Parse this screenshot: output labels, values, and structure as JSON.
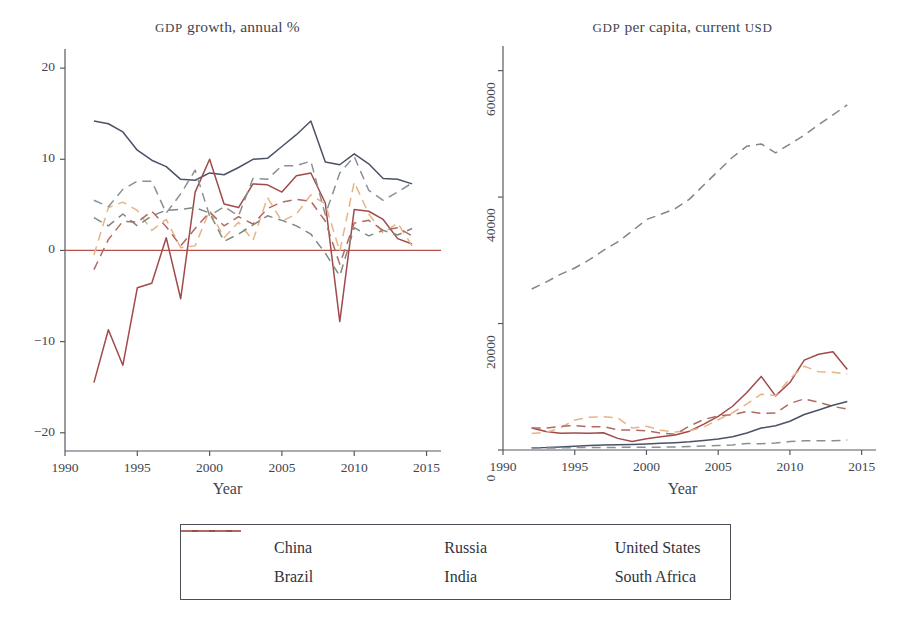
{
  "figure": {
    "axis_x_label": "Year",
    "series_colors": {
      "China": "#4b5268",
      "Brazil": "#e8b384",
      "Russia": "#a04a4a",
      "India": "#8a8f92",
      "United States": "#7d8a80",
      "South Africa": "#b06a62"
    },
    "zero_line_color": "#b5524c"
  },
  "legend": {
    "items": [
      {
        "label": "China",
        "color": "#4b5268",
        "dash": "solid"
      },
      {
        "label": "Russia",
        "color": "#a04a4a",
        "dash": "solid"
      },
      {
        "label": "United States",
        "color": "#7d8a80",
        "dash": "dashed"
      },
      {
        "label": "Brazil",
        "color": "#e8b384",
        "dash": "dashed"
      },
      {
        "label": "India",
        "color": "#8a8f92",
        "dash": "dashed"
      },
      {
        "label": "South Africa",
        "color": "#b06a62",
        "dash": "dashed"
      }
    ]
  },
  "chart_data": [
    {
      "type": "line",
      "id": "gdp-growth",
      "title": "GDP growth, annual %",
      "xlabel": "Year",
      "ylabel": "",
      "xlim": [
        1990,
        2016
      ],
      "ylim": [
        -22,
        21
      ],
      "xticks": [
        1990,
        1995,
        2000,
        2005,
        2010,
        2015
      ],
      "yticks": [
        -20,
        -10,
        0,
        10,
        20
      ],
      "grid": false,
      "legend_position": "below-figure",
      "zero_line": 0,
      "x": [
        1992,
        1993,
        1994,
        1995,
        1996,
        1997,
        1998,
        1999,
        2000,
        2001,
        2002,
        2003,
        2004,
        2005,
        2006,
        2007,
        2008,
        2009,
        2010,
        2011,
        2012,
        2013,
        2014
      ],
      "series": [
        {
          "name": "China",
          "dash": "solid",
          "color": "#4b5268",
          "values": [
            14.2,
            13.9,
            13.0,
            11.0,
            9.9,
            9.2,
            7.8,
            7.7,
            8.5,
            8.3,
            9.1,
            10.0,
            10.1,
            11.4,
            12.7,
            14.2,
            9.7,
            9.4,
            10.6,
            9.5,
            7.9,
            7.8,
            7.3
          ]
        },
        {
          "name": "Russia",
          "dash": "solid",
          "color": "#a04a4a",
          "values": [
            -14.5,
            -8.7,
            -12.6,
            -4.1,
            -3.6,
            1.4,
            -5.3,
            6.4,
            10.0,
            5.1,
            4.7,
            7.3,
            7.2,
            6.4,
            8.2,
            8.5,
            5.2,
            -7.8,
            4.5,
            4.3,
            3.4,
            1.3,
            0.7
          ]
        },
        {
          "name": "Brazil",
          "dash": "dashed",
          "color": "#e8b384",
          "values": [
            -0.5,
            4.7,
            5.3,
            4.4,
            2.2,
            3.4,
            0.3,
            0.5,
            4.4,
            1.4,
            3.1,
            1.1,
            5.8,
            3.2,
            4.0,
            6.1,
            5.1,
            -0.1,
            7.5,
            4.0,
            1.9,
            3.0,
            0.5
          ]
        },
        {
          "name": "India",
          "dash": "dashed",
          "color": "#8a8f92",
          "values": [
            5.5,
            4.8,
            6.7,
            7.6,
            7.6,
            4.1,
            6.2,
            8.8,
            3.8,
            4.8,
            3.8,
            7.9,
            7.8,
            9.3,
            9.3,
            9.8,
            3.9,
            8.5,
            10.3,
            6.6,
            5.5,
            6.4,
            7.4
          ]
        },
        {
          "name": "United States",
          "dash": "dashed",
          "color": "#7d8a80",
          "values": [
            3.6,
            2.7,
            4.0,
            2.7,
            3.8,
            4.4,
            4.5,
            4.7,
            4.1,
            1.0,
            1.8,
            2.8,
            3.8,
            3.3,
            2.7,
            1.8,
            -0.3,
            -2.8,
            2.5,
            1.6,
            2.2,
            1.7,
            2.4
          ]
        },
        {
          "name": "South Africa",
          "dash": "dashed",
          "color": "#b06a62",
          "values": [
            -2.1,
            1.2,
            3.2,
            3.1,
            4.3,
            2.6,
            0.5,
            2.4,
            4.2,
            2.7,
            3.7,
            2.9,
            4.6,
            5.3,
            5.6,
            5.4,
            3.2,
            -1.5,
            3.0,
            3.3,
            2.2,
            2.5,
            1.6
          ]
        }
      ]
    },
    {
      "type": "line",
      "id": "gdp-per-capita",
      "title": "GDP per capita, current USD",
      "xlabel": "Year",
      "ylabel": "",
      "xlim": [
        1990,
        2016
      ],
      "ylim": [
        0,
        62000
      ],
      "xticks": [
        1990,
        1995,
        2000,
        2005,
        2010,
        2015
      ],
      "yticks": [
        0,
        20000,
        40000,
        60000
      ],
      "grid": false,
      "legend_position": "below-figure",
      "x": [
        1992,
        1993,
        1994,
        1995,
        1996,
        1997,
        1998,
        1999,
        2000,
        2001,
        2002,
        2003,
        2004,
        2005,
        2006,
        2007,
        2008,
        2009,
        2010,
        2011,
        2012,
        2013,
        2014
      ],
      "series": [
        {
          "name": "United States",
          "dash": "dashed",
          "color": "#7d8a80",
          "values": [
            25467,
            26565,
            27777,
            28782,
            30068,
            31573,
            32929,
            34621,
            36450,
            37274,
            38166,
            39677,
            41922,
            44124,
            46302,
            48050,
            48400,
            47002,
            48374,
            49781,
            51457,
            53000,
            54600
          ]
        },
        {
          "name": "Russia",
          "dash": "solid",
          "color": "#a04a4a",
          "values": [
            3490,
            2930,
            2660,
            2670,
            2640,
            2740,
            1840,
            1330,
            1770,
            2100,
            2380,
            2980,
            4100,
            5320,
            6920,
            9100,
            11640,
            8560,
            10670,
            14210,
            15150,
            15540,
            12730
          ]
        },
        {
          "name": "Brazil",
          "dash": "dashed",
          "color": "#e8b384",
          "values": [
            2600,
            2790,
            3500,
            4750,
            5170,
            5280,
            5080,
            3470,
            3760,
            3130,
            2830,
            3060,
            3640,
            4790,
            5890,
            7290,
            8830,
            8620,
            11290,
            13250,
            12370,
            12300,
            12030
          ]
        },
        {
          "name": "South Africa",
          "dash": "dashed",
          "color": "#b06a62",
          "values": [
            3470,
            3480,
            3730,
            3870,
            3680,
            3700,
            3190,
            3150,
            3030,
            2660,
            2500,
            3780,
            4830,
            5400,
            5600,
            6100,
            5790,
            5860,
            7360,
            8090,
            7550,
            6890,
            6470
          ]
        },
        {
          "name": "China",
          "dash": "solid",
          "color": "#4b5268",
          "values": [
            366,
            377,
            473,
            609,
            709,
            781,
            828,
            873,
            959,
            1053,
            1148,
            1288,
            1508,
            1753,
            2099,
            2694,
            3468,
            3832,
            4550,
            5618,
            6337,
            7078,
            7683
          ]
        },
        {
          "name": "India",
          "dash": "dashed",
          "color": "#8a8f92",
          "values": [
            317,
            301,
            346,
            374,
            399,
            415,
            412,
            437,
            443,
            451,
            471,
            546,
            642,
            714,
            806,
            1028,
            991,
            1090,
            1345,
            1458,
            1444,
            1450,
            1576
          ]
        }
      ]
    }
  ]
}
